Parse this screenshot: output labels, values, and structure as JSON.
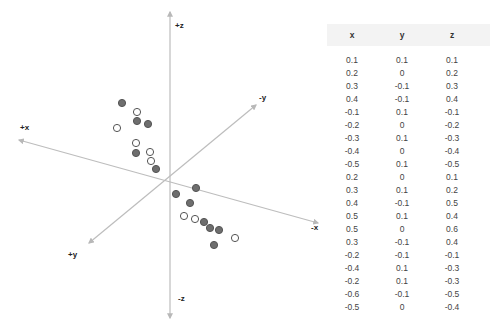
{
  "chart_data": {
    "type": "scatter",
    "title": "",
    "projection": "3d-oblique",
    "axes": {
      "x_pos_label": "+x",
      "x_neg_label": "-x",
      "y_pos_label": "+y",
      "y_neg_label": "-y",
      "z_pos_label": "+z",
      "z_neg_label": "-z"
    },
    "grid": false,
    "legend": null,
    "columns": [
      "x",
      "y",
      "z"
    ],
    "points": [
      {
        "x": 0.1,
        "y": 0.1,
        "z": 0.1
      },
      {
        "x": 0.2,
        "y": 0,
        "z": 0.2
      },
      {
        "x": 0.3,
        "y": -0.1,
        "z": 0.3
      },
      {
        "x": 0.4,
        "y": -0.1,
        "z": 0.4
      },
      {
        "x": -0.1,
        "y": 0.1,
        "z": -0.1
      },
      {
        "x": -0.2,
        "y": 0,
        "z": -0.2
      },
      {
        "x": -0.3,
        "y": 0.1,
        "z": -0.3
      },
      {
        "x": -0.4,
        "y": 0,
        "z": -0.4
      },
      {
        "x": -0.5,
        "y": 0.1,
        "z": -0.5
      },
      {
        "x": 0.2,
        "y": 0,
        "z": 0.1
      },
      {
        "x": 0.3,
        "y": 0.1,
        "z": 0.2
      },
      {
        "x": 0.4,
        "y": -0.1,
        "z": 0.5
      },
      {
        "x": 0.5,
        "y": 0.1,
        "z": 0.4
      },
      {
        "x": 0.5,
        "y": 0,
        "z": 0.6
      },
      {
        "x": 0.3,
        "y": -0.1,
        "z": 0.4
      },
      {
        "x": -0.2,
        "y": -0.1,
        "z": -0.1
      },
      {
        "x": -0.4,
        "y": 0.1,
        "z": -0.3
      },
      {
        "x": -0.2,
        "y": 0.1,
        "z": -0.3
      },
      {
        "x": -0.6,
        "y": -0.1,
        "z": -0.5
      },
      {
        "x": -0.5,
        "y": 0,
        "z": -0.4
      }
    ],
    "plotted_markers": [
      {
        "px": 122,
        "py": 103,
        "style": "filled"
      },
      {
        "px": 137,
        "py": 112,
        "style": "hollow"
      },
      {
        "px": 137,
        "py": 121,
        "style": "filled"
      },
      {
        "px": 148,
        "py": 124,
        "style": "filled"
      },
      {
        "px": 117,
        "py": 128,
        "style": "hollow"
      },
      {
        "px": 136,
        "py": 143,
        "style": "hollow"
      },
      {
        "px": 136,
        "py": 153,
        "style": "filled"
      },
      {
        "px": 150,
        "py": 152,
        "style": "hollow"
      },
      {
        "px": 151,
        "py": 161,
        "style": "hollow"
      },
      {
        "px": 156,
        "py": 169,
        "style": "filled"
      },
      {
        "px": 196,
        "py": 188,
        "style": "filled"
      },
      {
        "px": 176,
        "py": 194,
        "style": "filled"
      },
      {
        "px": 190,
        "py": 203,
        "style": "filled"
      },
      {
        "px": 184,
        "py": 216,
        "style": "hollow"
      },
      {
        "px": 195,
        "py": 219,
        "style": "hollow"
      },
      {
        "px": 204,
        "py": 222,
        "style": "filled"
      },
      {
        "px": 210,
        "py": 228,
        "style": "filled"
      },
      {
        "px": 219,
        "py": 230,
        "style": "filled"
      },
      {
        "px": 235,
        "py": 238,
        "style": "hollow"
      },
      {
        "px": 214,
        "py": 245,
        "style": "filled"
      }
    ]
  },
  "colors": {
    "axis": "#b8b8b8",
    "marker_filled": "#6e6e6e",
    "marker_edge": "#555555",
    "marker_hollow_fill": "#ffffff",
    "table_text": "#444444",
    "header_band": "#f3f3f3"
  },
  "table": {
    "headers": [
      "x",
      "y",
      "z"
    ],
    "rows": [
      [
        "0.1",
        "0.1",
        "0.1"
      ],
      [
        "0.2",
        "0",
        "0.2"
      ],
      [
        "0.3",
        "-0.1",
        "0.3"
      ],
      [
        "0.4",
        "-0.1",
        "0.4"
      ],
      [
        "-0.1",
        "0.1",
        "-0.1"
      ],
      [
        "-0.2",
        "0",
        "-0.2"
      ],
      [
        "-0.3",
        "0.1",
        "-0.3"
      ],
      [
        "-0.4",
        "0",
        "-0.4"
      ],
      [
        "-0.5",
        "0.1",
        "-0.5"
      ],
      [
        "0.2",
        "0",
        "0.1"
      ],
      [
        "0.3",
        "0.1",
        "0.2"
      ],
      [
        "0.4",
        "-0.1",
        "0.5"
      ],
      [
        "0.5",
        "0.1",
        "0.4"
      ],
      [
        "0.5",
        "0",
        "0.6"
      ],
      [
        "0.3",
        "-0.1",
        "0.4"
      ],
      [
        "-0.2",
        "-0.1",
        "-0.1"
      ],
      [
        "-0.4",
        "0.1",
        "-0.3"
      ],
      [
        "-0.2",
        "0.1",
        "-0.3"
      ],
      [
        "-0.6",
        "-0.1",
        "-0.5"
      ],
      [
        "-0.5",
        "0",
        "-0.4"
      ]
    ]
  }
}
